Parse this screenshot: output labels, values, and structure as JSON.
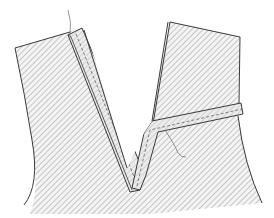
{
  "illustration": {
    "subject": "V-neck binding sewing diagram",
    "colors": {
      "background": "#ffffff",
      "outline": "#3a3a3a",
      "hatch": "#9a9a9a",
      "strip_fill": "#e6e6e6",
      "stitch": "#555555",
      "thread": "#6a6a6a"
    },
    "parts": [
      {
        "name": "left-garment-panel"
      },
      {
        "name": "right-garment-panel"
      },
      {
        "name": "binding-strip-left"
      },
      {
        "name": "binding-strip-right"
      },
      {
        "name": "thread-tail-top"
      },
      {
        "name": "thread-tail-bottom"
      }
    ]
  }
}
